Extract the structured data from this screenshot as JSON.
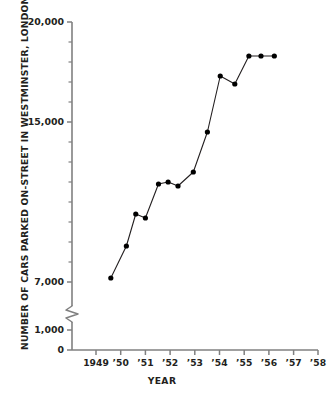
{
  "chart_data": {
    "type": "line",
    "title": "",
    "subtitle": "",
    "xlabel": "YEAR",
    "ylabel": "NUMBER OF CARS PARKED ON-STREET IN WESTMINSTER, LONDON",
    "x_tick_labels": [
      "1949",
      "’50",
      "’51",
      "’52",
      "’53",
      "’54",
      "’55",
      "’56",
      "’57",
      "’58"
    ],
    "x_tick_values": [
      1949,
      1950,
      1951,
      1952,
      1953,
      1954,
      1955,
      1956,
      1957,
      1958
    ],
    "y_tick_labels": [
      "0",
      "1,000",
      "7,000",
      "15,000",
      "20,000"
    ],
    "y_tick_values": [
      0,
      1000,
      7000,
      15000,
      20000
    ],
    "y_minor_tick_values": [
      8000,
      9000,
      10000,
      11000,
      12000,
      13000,
      14000,
      16000,
      17000,
      18000,
      19000
    ],
    "ylim": [
      1000,
      20000
    ],
    "xlim": [
      1948.6,
      1958.2
    ],
    "axis_break": true,
    "axis_break_between": [
      1000,
      7000
    ],
    "grid": false,
    "legend": "none",
    "marker": "filled-circle",
    "line_color": "#231f20",
    "marker_color": "#000000",
    "axis_color": "#808080",
    "series": [
      {
        "name": "Cars parked on-street",
        "x": [
          1949.6,
          1950.23,
          1950.61,
          1951.0,
          1951.53,
          1951.92,
          1952.32,
          1952.94,
          1953.51,
          1954.03,
          1954.62,
          1955.19,
          1955.68,
          1956.22
        ],
        "values": [
          7200,
          8800,
          10400,
          10200,
          11900,
          12000,
          11800,
          12500,
          14500,
          17300,
          16900,
          18300,
          18300,
          18300
        ]
      }
    ],
    "points": [
      {
        "x": 1949.6,
        "y": 7200
      },
      {
        "x": 1950.23,
        "y": 8800
      },
      {
        "x": 1950.61,
        "y": 10400
      },
      {
        "x": 1951.0,
        "y": 10200
      },
      {
        "x": 1951.53,
        "y": 11900
      },
      {
        "x": 1951.92,
        "y": 12000
      },
      {
        "x": 1952.32,
        "y": 11800
      },
      {
        "x": 1952.94,
        "y": 12500
      },
      {
        "x": 1953.51,
        "y": 14500
      },
      {
        "x": 1954.03,
        "y": 17300
      },
      {
        "x": 1954.62,
        "y": 16900
      },
      {
        "x": 1955.19,
        "y": 18300
      },
      {
        "x": 1955.68,
        "y": 18300
      }
    ]
  }
}
